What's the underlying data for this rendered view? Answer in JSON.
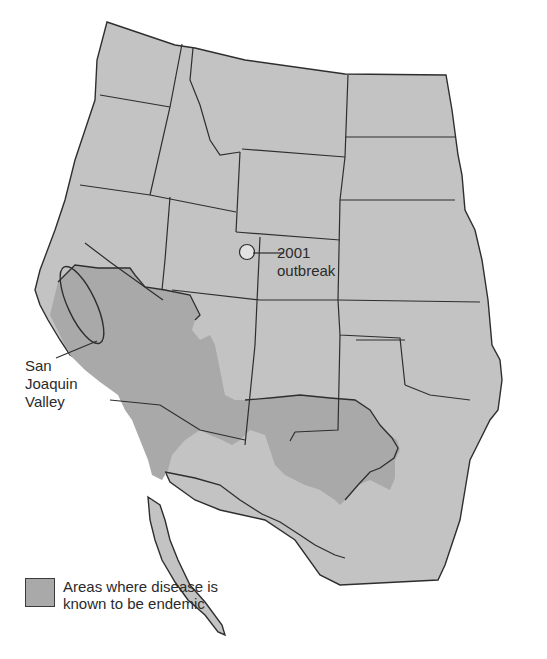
{
  "map": {
    "title": "",
    "region": "Western United States and northern Mexico",
    "colors": {
      "land": "#c3c3c3",
      "endemic": "#a9a9a9",
      "outbreak_marker": "#e2e2e2",
      "border": "#2e2e2e",
      "background": "#ffffff"
    }
  },
  "annotations": {
    "outbreak": {
      "line1": "2001",
      "line2": "outbreak"
    },
    "san_joaquin": {
      "line1": "San",
      "line2": "Joaquin",
      "line3": "Valley"
    }
  },
  "legend": {
    "swatch_color": "#a9a9a9",
    "text": "Areas where disease is known to be endemic"
  }
}
